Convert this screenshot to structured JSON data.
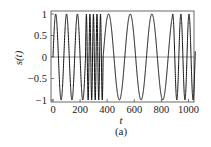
{
  "figure": {
    "caption": "(a)"
  },
  "chart_data": {
    "type": "line",
    "title": "",
    "xlabel": "t",
    "ylabel": "s(t)",
    "xlim": [
      0,
      1060
    ],
    "ylim": [
      -1,
      1
    ],
    "xticks": [
      0,
      200,
      400,
      600,
      800,
      1000
    ],
    "xtick_labels": [
      "0",
      "200",
      "400",
      "600",
      "800",
      "1000"
    ],
    "yticks": [
      1,
      0.5,
      0,
      -0.5,
      -1
    ],
    "ytick_labels": [
      "1",
      "0.5",
      "0",
      "−0.5",
      "−1"
    ],
    "grid": false,
    "legend": null,
    "zero_line": true,
    "series": [
      {
        "name": "s(t)",
        "description": "piecewise sinusoid with changing frequency",
        "segments": [
          {
            "t_start": 0,
            "t_end": 240,
            "period": 80
          },
          {
            "t_start": 240,
            "t_end": 370,
            "period": 26
          },
          {
            "t_start": 370,
            "t_end": 880,
            "period": 160
          },
          {
            "t_start": 880,
            "t_end": 1050,
            "period": 60
          }
        ],
        "end_value_approx": 0.1
      }
    ],
    "colors": {
      "line": "#111111",
      "frame": "#444444",
      "zero_line": "#666666"
    }
  }
}
